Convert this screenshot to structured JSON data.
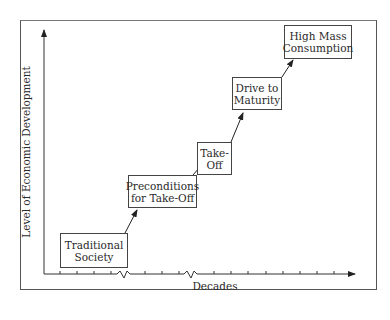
{
  "diagram": {
    "type": "staircase-stages",
    "y_axis_label": "Level of Economic Development",
    "x_axis_label": "Decades",
    "stages": [
      {
        "label": "Traditional\nSociety",
        "x": 60,
        "y": 233,
        "w": 68,
        "h": 35
      },
      {
        "label": "Preconditions\nfor Take-Off",
        "x": 128,
        "y": 175,
        "w": 69,
        "h": 33
      },
      {
        "label": "Take-\nOff",
        "x": 197,
        "y": 142,
        "w": 35,
        "h": 33
      },
      {
        "label": "Drive to\nMaturity",
        "x": 232,
        "y": 77,
        "w": 50,
        "h": 33
      },
      {
        "label": "High Mass\nConsumption",
        "x": 284,
        "y": 25,
        "w": 68,
        "h": 34
      }
    ],
    "arrows": [
      {
        "from": [
          128,
          233
        ],
        "to": [
          140,
          208
        ]
      },
      {
        "from": [
          196,
          175
        ],
        "to": [
          208,
          158
        ]
      },
      {
        "from": [
          232,
          142
        ],
        "to": [
          242,
          125
        ]
      },
      {
        "from": [
          282,
          77
        ],
        "to": [
          294,
          58
        ]
      }
    ],
    "axis_breaks": [
      "x-axis break near first third",
      "x-axis break near middle"
    ],
    "colors": {
      "line": "#333333",
      "text": "#2a2a2a",
      "background": "#ffffff"
    }
  }
}
